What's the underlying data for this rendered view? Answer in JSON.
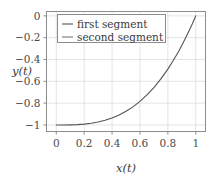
{
  "chart_data": {
    "type": "line",
    "title": "",
    "xlabel": "x(t)",
    "ylabel": "y(t)",
    "xlim": [
      -0.07,
      1.07
    ],
    "ylim": [
      -1.06,
      0.04
    ],
    "xticks": [
      "0",
      "0.2",
      "0.4",
      "0.6",
      "0.8",
      "1"
    ],
    "xtick_values": [
      0,
      0.2,
      0.4,
      0.6,
      0.8,
      1
    ],
    "yticks": [
      "0",
      "−0.2",
      "−0.4",
      "−0.6",
      "−0.8",
      "−1"
    ],
    "ytick_values": [
      0,
      -0.2,
      -0.4,
      -0.6,
      -0.8,
      -1
    ],
    "grid": true,
    "legend_position": "upper left",
    "series": [
      {
        "name": "first segment",
        "color": "#555555",
        "x": [
          0.0,
          0.05,
          0.1,
          0.15,
          0.2,
          0.25,
          0.3,
          0.35,
          0.4,
          0.45,
          0.5,
          0.55,
          0.6,
          0.65,
          0.7,
          0.75,
          0.8,
          0.84,
          0.88,
          0.91,
          0.94,
          0.96,
          0.975,
          0.985,
          0.992,
          0.997,
          1.0
        ],
        "y": [
          -1.0,
          -1.0,
          -0.999,
          -0.997,
          -0.992,
          -0.984,
          -0.973,
          -0.957,
          -0.936,
          -0.909,
          -0.875,
          -0.834,
          -0.784,
          -0.725,
          -0.657,
          -0.578,
          -0.488,
          -0.407,
          -0.319,
          -0.246,
          -0.169,
          -0.115,
          -0.074,
          -0.045,
          -0.024,
          -0.009,
          0.0
        ]
      },
      {
        "name": "second segment",
        "color": "#7a7a7a",
        "x": [],
        "y": []
      }
    ]
  },
  "legend": {
    "items": [
      {
        "label": "first segment",
        "color": "#555555"
      },
      {
        "label": "second segment",
        "color": "#7a7a7a"
      }
    ]
  },
  "axes": {
    "x_label": "x(t)",
    "y_label": "y(t)"
  },
  "style": {
    "background": "#ffffff",
    "frame_color": "#8c8c8c",
    "grid_color": "#dddddd",
    "tick_label_color": "#4a4a4a"
  }
}
